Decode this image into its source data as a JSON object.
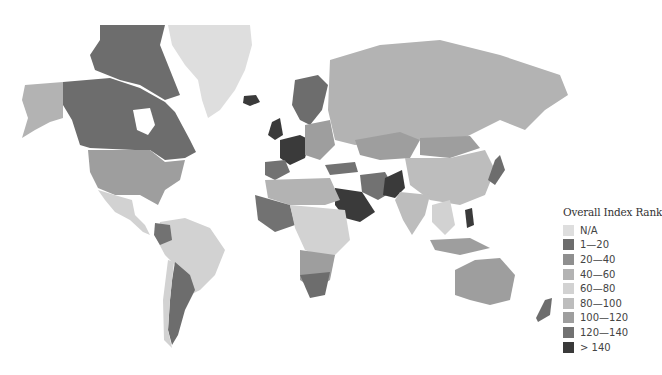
{
  "legend": {
    "title": "Overall Index Rank",
    "items": [
      {
        "label": "N/A",
        "color": "#dedede"
      },
      {
        "label": "1—20",
        "color": "#6d6d6d"
      },
      {
        "label": "20—40",
        "color": "#8f8f8f"
      },
      {
        "label": "40—60",
        "color": "#b3b3b3"
      },
      {
        "label": "60—80",
        "color": "#d2d2d2"
      },
      {
        "label": "80—100",
        "color": "#bdbdbd"
      },
      {
        "label": "100—120",
        "color": "#9e9e9e"
      },
      {
        "label": "120—140",
        "color": "#727272"
      },
      {
        "label": "> 140",
        "color": "#3a3a3a"
      }
    ]
  },
  "regions": [
    {
      "name": "Greenland",
      "rank_band": "N/A"
    },
    {
      "name": "Canada",
      "rank_band": "1—20"
    },
    {
      "name": "United States",
      "rank_band": "20—40"
    },
    {
      "name": "Russia",
      "rank_band": "40—60"
    },
    {
      "name": "Saudi Arabia",
      "rank_band": "> 140"
    },
    {
      "name": "Pakistan",
      "rank_band": "> 140"
    },
    {
      "name": "Australia",
      "rank_band": "20—40"
    },
    {
      "name": "Brazil",
      "rank_band": "60—80"
    },
    {
      "name": "Argentina",
      "rank_band": "1—20"
    },
    {
      "name": "China",
      "rank_band": "80—100"
    },
    {
      "name": "India",
      "rank_band": "80—100"
    },
    {
      "name": "New Zealand",
      "rank_band": "1—20"
    },
    {
      "name": "South Africa",
      "rank_band": "1—20"
    },
    {
      "name": "Scandinavia",
      "rank_band": "1—20"
    }
  ]
}
